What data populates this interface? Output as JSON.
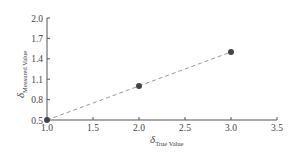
{
  "chart_data": {
    "type": "line",
    "title": "",
    "xlabel": "δ_True Value",
    "ylabel": "δ_Measured Value",
    "xlabel_symbol": "δ",
    "xlabel_sub": "True Value",
    "ylabel_symbol": "δ",
    "ylabel_sub": "Measured Value",
    "xlim": [
      1.0,
      3.5
    ],
    "ylim": [
      0.5,
      2.0
    ],
    "x_ticks": [
      "1.0",
      "1.5",
      "2.0",
      "2.5",
      "3.0",
      "3.5"
    ],
    "y_ticks": [
      "0.5",
      "0.8",
      "1.1",
      "1.4",
      "1.7",
      "2.0"
    ],
    "grid": false,
    "legend": null,
    "series": [
      {
        "name": "measurements",
        "line_style": "dashed",
        "marker": "circle",
        "x": [
          1.0,
          2.0,
          3.0
        ],
        "y": [
          0.5,
          1.0,
          1.5
        ]
      }
    ]
  },
  "colors": {
    "axis": "#555555",
    "line": "#999999",
    "marker": "#444444",
    "text": "#444444"
  }
}
